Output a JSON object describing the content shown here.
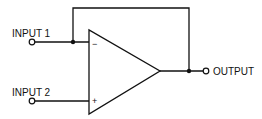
{
  "diagram": {
    "type": "op-amp voltage follower / comparator schematic",
    "labels": {
      "input1": "INPUT 1",
      "input2": "INPUT 2",
      "output": "OUTPUT"
    },
    "opamp": {
      "inverting_sign": "−",
      "noninverting_sign": "+"
    },
    "connections": [
      "INPUT 1 -> inverting (-) input",
      "INPUT 2 -> non-inverting (+) input",
      "OUTPUT -> feedback to inverting (-) input"
    ],
    "colors": {
      "line": "#111111",
      "background": "#ffffff"
    }
  }
}
